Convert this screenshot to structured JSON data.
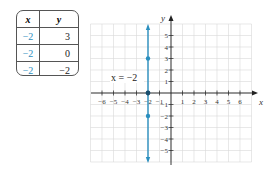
{
  "table": {
    "headers": [
      "x",
      "y"
    ],
    "rows": [
      {
        "x": "−2",
        "y": "3"
      },
      {
        "x": "−2",
        "y": "0"
      },
      {
        "x": "−2",
        "y": "−2"
      }
    ]
  },
  "graph": {
    "x_axis_label": "x",
    "y_axis_label": "y",
    "equation_label": "x = −2",
    "x_ticks": [
      "−6",
      "−5",
      "−4",
      "−3",
      "−2",
      "−1",
      "1",
      "2",
      "3",
      "4",
      "5",
      "6"
    ],
    "y_ticks": [
      "5",
      "4",
      "3",
      "2",
      "1",
      "−1",
      "−2",
      "−3",
      "−4",
      "−5"
    ],
    "line_color": "#2a8fbf",
    "point_color": "#2a8fbf"
  },
  "chart_data": {
    "type": "line",
    "title": "",
    "xlabel": "x",
    "ylabel": "y",
    "xlim": [
      -7,
      7
    ],
    "ylim": [
      -6,
      6
    ],
    "grid": true,
    "annotations": [
      "x = −2"
    ],
    "series": [
      {
        "name": "x = −2",
        "kind": "vertical line",
        "x": [
          -2,
          -2
        ],
        "y": [
          -6,
          6
        ],
        "color": "#2a8fbf"
      },
      {
        "name": "plotted points",
        "kind": "scatter",
        "x": [
          -2,
          -2,
          -2
        ],
        "y": [
          3,
          0,
          -2
        ],
        "color": "#2a8fbf"
      }
    ],
    "table": {
      "columns": [
        "x",
        "y"
      ],
      "rows": [
        [
          -2,
          3
        ],
        [
          -2,
          0
        ],
        [
          -2,
          -2
        ]
      ]
    }
  }
}
